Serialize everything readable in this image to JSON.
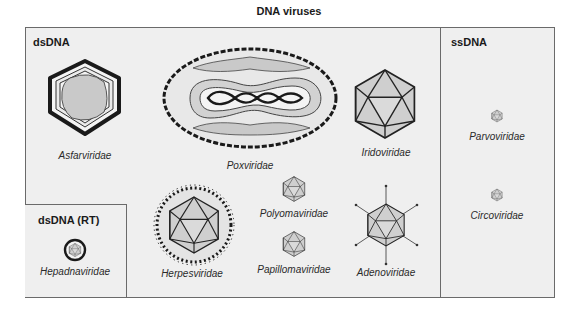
{
  "title": "DNA viruses",
  "sections": {
    "dsdna": "dsDNA",
    "dsdna_rt": "dsDNA (RT)",
    "ssdna": "ssDNA"
  },
  "families": {
    "asfarviridae": "Asfarviridae",
    "poxviridae": "Poxviridae",
    "iridoviridae": "Iridoviridae",
    "herpesviridae": "Herpesviridae",
    "polyomaviridae": "Polyomaviridae",
    "papillomaviridae": "Papillomaviridae",
    "adenoviridae": "Adenoviridae",
    "hepadnaviridae": "Hepadnaviridae",
    "parvoviridae": "Parvoviridae",
    "circoviridae": "Circoviridae"
  },
  "colors": {
    "panel_bg": "#efefef",
    "border": "#6a6a6a",
    "capsid_fill": "#cfcfcf",
    "outline": "#222222"
  }
}
